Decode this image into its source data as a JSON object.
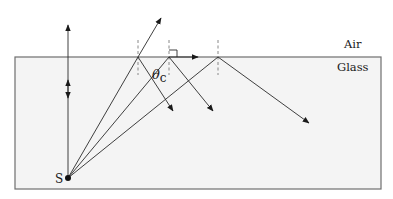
{
  "diagram": {
    "media": {
      "upper": "Air",
      "lower": "Glass"
    },
    "source_label": "S",
    "angle_label": {
      "symbol": "θ",
      "subscript": "c"
    },
    "colors": {
      "glass_fill": "#f4f4f4",
      "glass_border": "#6e6e6e",
      "ray": "#2a2a2a",
      "normal_dashed": "#7a7a7a",
      "text": "#1a1a1a"
    },
    "rays": [
      {
        "name": "normal-incidence",
        "hit_x": 68,
        "transmitted": "straight up",
        "reflected": "straight down (partial)"
      },
      {
        "name": "sub-critical",
        "hit_x": 138,
        "transmitted": "refracted away from normal",
        "reflected": "partial"
      },
      {
        "name": "critical-angle",
        "hit_x": 169,
        "transmitted": "grazes along surface (90°)",
        "reflected": "partial"
      },
      {
        "name": "beyond-critical",
        "hit_x": 218,
        "transmitted": "none",
        "reflected": "total internal reflection"
      }
    ]
  }
}
